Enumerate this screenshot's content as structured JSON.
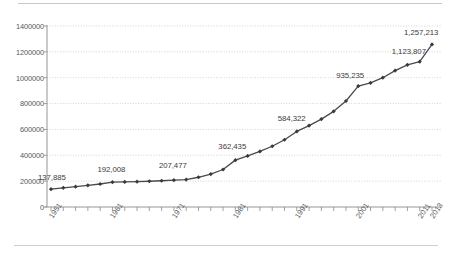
{
  "figure": {
    "background": "#ffffff",
    "rule_color": "#c9c9c9"
  },
  "chart_data": {
    "type": "line",
    "title": "",
    "subtitle": "",
    "xlabel": "",
    "ylabel": "",
    "grid": true,
    "legend": false,
    "legend_position": "none",
    "line_color": "#4a4a4c",
    "marker": "diamond",
    "marker_color": "#3a3a3c",
    "xlim": [
      1951,
      2013
    ],
    "ylim": [
      0,
      1400000
    ],
    "ytick_labels": [
      "0",
      "200000",
      "400000",
      "600000",
      "800000",
      "1000000",
      "1200000",
      "1400000"
    ],
    "ytick_values": [
      0,
      200000,
      400000,
      600000,
      800000,
      1000000,
      1200000,
      1400000
    ],
    "xtick_labels": [
      "1951",
      "1961",
      "1971",
      "1981",
      "1991",
      "2001",
      "2011",
      "2013"
    ],
    "xtick_values": [
      1951,
      1961,
      1971,
      1981,
      1991,
      2001,
      2011,
      2013
    ],
    "x": [
      1951,
      1953,
      1955,
      1957,
      1959,
      1961,
      1963,
      1965,
      1967,
      1969,
      1971,
      1973,
      1975,
      1977,
      1979,
      1981,
      1983,
      1985,
      1987,
      1989,
      1991,
      1993,
      1995,
      1997,
      1999,
      2001,
      2003,
      2005,
      2007,
      2009,
      2011,
      2013
    ],
    "values": [
      137885,
      148000,
      157000,
      168000,
      178000,
      192008,
      194000,
      196000,
      199000,
      203000,
      207477,
      212000,
      230000,
      255000,
      290000,
      362435,
      395000,
      430000,
      470000,
      520000,
      584322,
      630000,
      680000,
      740000,
      820000,
      935235,
      960000,
      1000000,
      1055000,
      1100000,
      1123807,
      1257213
    ],
    "point_labels": [
      {
        "year": 1951,
        "value": 137885,
        "text": "137,885"
      },
      {
        "year": 1961,
        "value": 192008,
        "text": "192,008"
      },
      {
        "year": 1971,
        "value": 207477,
        "text": "207,477"
      },
      {
        "year": 1981,
        "value": 362435,
        "text": "362,435"
      },
      {
        "year": 1991,
        "value": 584322,
        "text": "584,322"
      },
      {
        "year": 2001,
        "value": 935235,
        "text": "935,235"
      },
      {
        "year": 2011,
        "value": 1123807,
        "text": "1,123,807"
      },
      {
        "year": 2013,
        "value": 1257213,
        "text": "1,257,213"
      }
    ]
  }
}
